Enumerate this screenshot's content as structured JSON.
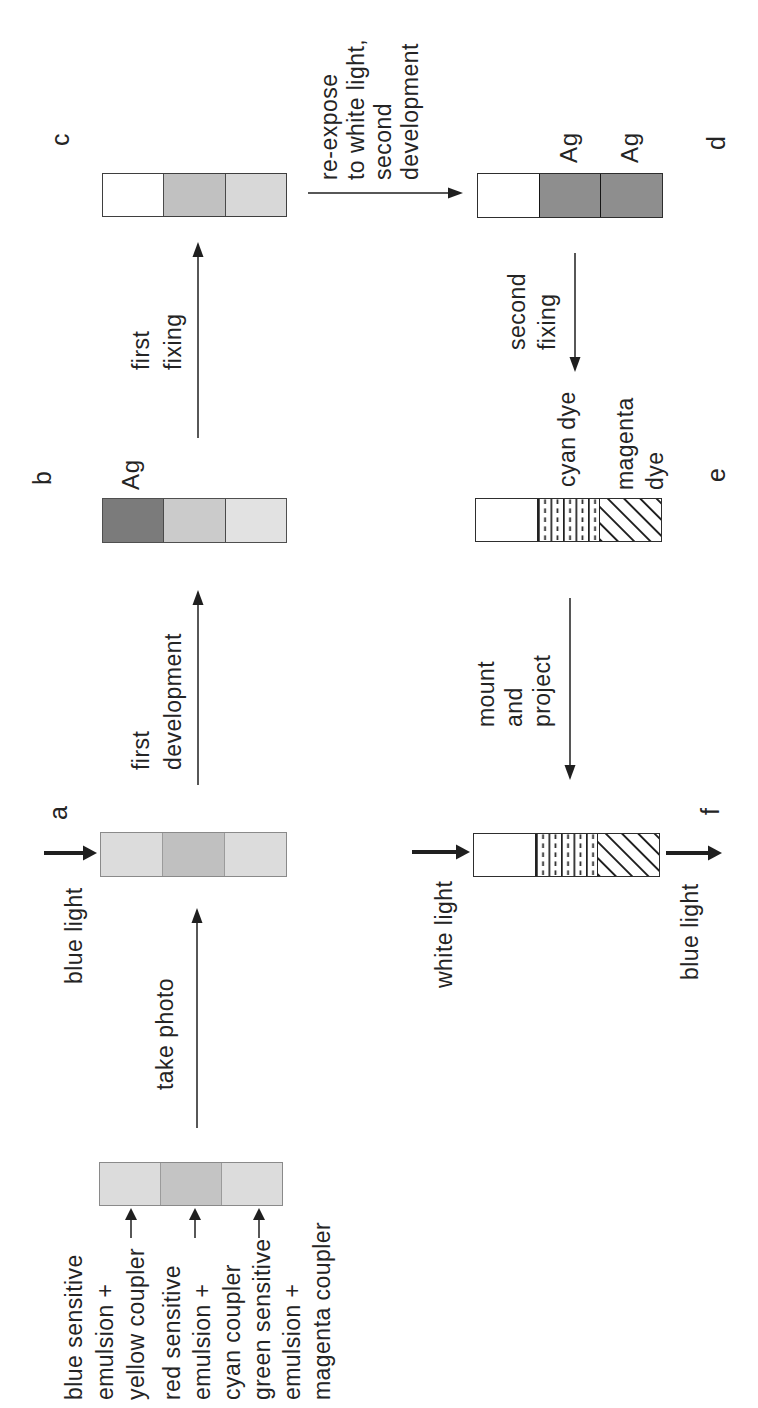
{
  "figure": {
    "background": "#ffffff",
    "ink": "#1f1f1f",
    "arrow_kinds": {
      "thin": {
        "hl": 15,
        "hw": 11,
        "sw": 1.5
      },
      "thick": {
        "hl": 14,
        "hw": 15,
        "sw": 4
      },
      "small": {
        "hl": 12,
        "hw": 12,
        "sw": 1.5
      }
    },
    "bars": [
      {
        "id": "film",
        "x": 202,
        "y": 99,
        "w": 44,
        "h": 184,
        "border": "#8a8a8a",
        "divider": "#9b9b9b",
        "segments": [
          {
            "color": "#dcdcdc"
          },
          {
            "color": "#c4c4c4"
          },
          {
            "color": "#dcdcdc"
          }
        ]
      },
      {
        "id": "a",
        "x": 531,
        "y": 100,
        "w": 45,
        "h": 187,
        "border": "#8a8a8a",
        "divider": "#9b9b9b",
        "segments": [
          {
            "color": "#dcdcdc"
          },
          {
            "color": "#c0c0c0"
          },
          {
            "color": "#dcdcdc"
          }
        ]
      },
      {
        "id": "b",
        "x": 865,
        "y": 102,
        "w": 45,
        "h": 185,
        "border": "#4f4f4f",
        "divider": "#4a4a4a",
        "segments": [
          {
            "color": "#7b7b7b"
          },
          {
            "color": "#cbcbcb"
          },
          {
            "color": "#e2e2e2"
          }
        ]
      },
      {
        "id": "c",
        "x": 1191,
        "y": 102,
        "w": 44,
        "h": 185,
        "border": "#3f3f3f",
        "divider": "#4a4a4a",
        "segments": [
          {
            "color": "#ffffff"
          },
          {
            "color": "#c1c1c1"
          },
          {
            "color": "#d8d8d8"
          }
        ]
      },
      {
        "id": "d",
        "x": 1190,
        "y": 477,
        "w": 45,
        "h": 186,
        "border": "#2e2e2e",
        "divider": "#151515",
        "segments": [
          {
            "color": "#ffffff"
          },
          {
            "color": "#8e8e8e"
          },
          {
            "color": "#8e8e8e"
          }
        ]
      },
      {
        "id": "e",
        "x": 866,
        "y": 475,
        "w": 44,
        "h": 187,
        "border": "#2e2e2e",
        "divider": "#222222",
        "segments": [
          {
            "color": "#ffffff"
          },
          {
            "pattern": "cyan-dye"
          },
          {
            "pattern": "magenta-dye"
          }
        ]
      },
      {
        "id": "f",
        "x": 531,
        "y": 473,
        "w": 44,
        "h": 187,
        "border": "#2e2e2e",
        "divider": "#222222",
        "segments": [
          {
            "color": "#ffffff"
          },
          {
            "pattern": "cyan-dye"
          },
          {
            "pattern": "magenta-dye"
          }
        ]
      }
    ],
    "stage_letters": [
      {
        "text": "a",
        "x": 588,
        "y": 44
      },
      {
        "text": "b",
        "x": 923,
        "y": 28
      },
      {
        "text": "c",
        "x": 1262,
        "y": 46
      },
      {
        "text": "d",
        "x": 1258,
        "y": 702
      },
      {
        "text": "e",
        "x": 926,
        "y": 702
      },
      {
        "text": "f",
        "x": 593,
        "y": 696
      }
    ],
    "ag_labels": [
      {
        "text": "Ag",
        "x": 918,
        "y": 118
      },
      {
        "text": "Ag",
        "x": 1245,
        "y": 556
      },
      {
        "text": "Ag",
        "x": 1245,
        "y": 617
      }
    ],
    "texts": [
      {
        "name": "take-photo",
        "x": 318,
        "y": 151,
        "lines": [
          "take photo"
        ]
      },
      {
        "name": "first-development",
        "x": 638,
        "y": 125,
        "lh": 32,
        "lines": [
          "first",
          "development"
        ]
      },
      {
        "name": "first-fixing",
        "x": 1038,
        "y": 125,
        "lh": 32,
        "lines": [
          "first",
          "fixing"
        ]
      },
      {
        "name": "re-expose-second-develop",
        "x": 1228,
        "y": 316,
        "lh": 27,
        "lines": [
          "re-expose",
          "to white light,",
          "second",
          "development"
        ]
      },
      {
        "name": "second-fixing",
        "x": 1058,
        "y": 502,
        "lh": 30,
        "lines": [
          "second",
          "fixing"
        ]
      },
      {
        "name": "mount-and-project",
        "x": 681,
        "y": 472,
        "lh": 28,
        "lines": [
          "mount",
          "and",
          "project"
        ]
      },
      {
        "name": "cyan-dye",
        "x": 921,
        "y": 553,
        "lines": [
          "cyan dye"
        ]
      },
      {
        "name": "magenta-dye",
        "x": 918,
        "y": 610,
        "lh": 30,
        "lines": [
          "magenta",
          "dye"
        ]
      },
      {
        "name": "blue-light-in",
        "x": 424,
        "y": 60,
        "lines": [
          "blue light"
        ]
      },
      {
        "name": "white-light-in",
        "x": 420,
        "y": 430,
        "lines": [
          "white light"
        ]
      },
      {
        "name": "blue-light-out",
        "x": 428,
        "y": 676,
        "lines": [
          "blue light"
        ]
      },
      {
        "name": "layer-blue-sensitive",
        "x": 8,
        "y": 59,
        "lh": 31,
        "lines": [
          "blue sensitive",
          "emulsion +",
          "yellow coupler"
        ]
      },
      {
        "name": "layer-red-sensitive",
        "x": 8,
        "y": 157,
        "lh": 30,
        "lines": [
          "red sensitive",
          "emulsion +",
          "cyan coupler"
        ]
      },
      {
        "name": "layer-green-sensitive",
        "x": 8,
        "y": 247,
        "lh": 30,
        "lines": [
          "green sensitive",
          "emulsion +",
          "magenta coupler"
        ]
      }
    ],
    "arrows": [
      {
        "name": "take-photo-arrow",
        "kind": "thin",
        "x1": 280,
        "y1": 197,
        "x2": 500,
        "y2": 197
      },
      {
        "name": "first-development-arrow",
        "kind": "thin",
        "x1": 623,
        "y1": 198,
        "x2": 818,
        "y2": 198
      },
      {
        "name": "first-fixing-arrow",
        "kind": "thin",
        "x1": 970,
        "y1": 198,
        "x2": 1166,
        "y2": 198
      },
      {
        "name": "re-expose-arrow",
        "kind": "thin",
        "x1": 1215,
        "y1": 308,
        "x2": 1215,
        "y2": 463
      },
      {
        "name": "second-fixing-arrow",
        "kind": "thin",
        "x1": 1155,
        "y1": 575,
        "x2": 1036,
        "y2": 575
      },
      {
        "name": "mount-project-arrow",
        "kind": "thin",
        "x1": 810,
        "y1": 570,
        "x2": 628,
        "y2": 570
      },
      {
        "name": "blue-light-in-arrow",
        "kind": "thick",
        "x1": 555,
        "y1": 44,
        "x2": 555,
        "y2": 97
      },
      {
        "name": "white-light-in-arrow",
        "kind": "thick",
        "x1": 556,
        "y1": 412,
        "x2": 556,
        "y2": 470
      },
      {
        "name": "blue-light-out-arrow",
        "kind": "thick",
        "x1": 555,
        "y1": 666,
        "x2": 555,
        "y2": 722
      },
      {
        "name": "layer-arrow-blue",
        "kind": "small",
        "x1": 170,
        "y1": 131,
        "x2": 200,
        "y2": 131
      },
      {
        "name": "layer-arrow-red",
        "kind": "small",
        "x1": 170,
        "y1": 195,
        "x2": 200,
        "y2": 195
      },
      {
        "name": "layer-arrow-green",
        "kind": "small",
        "x1": 170,
        "y1": 259,
        "x2": 200,
        "y2": 259
      }
    ]
  }
}
